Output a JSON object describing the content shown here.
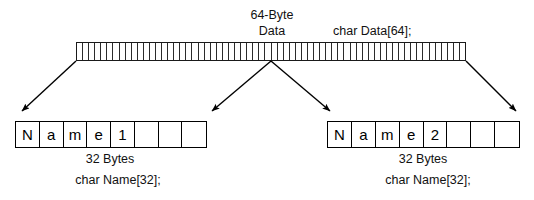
{
  "diagram": {
    "background": "#ffffff",
    "line_color": "#000000",
    "data_strip": {
      "label_line1": "64-Byte",
      "label_line2": "Data",
      "declaration": "char Data[64];",
      "cell_count": 64,
      "total_bytes": 64
    },
    "fields": [
      {
        "id": "name1",
        "cells": [
          "N",
          "a",
          "m",
          "e",
          "1",
          "",
          "",
          ""
        ],
        "size_label": "32 Bytes",
        "declaration": "char Name[32];",
        "size_bytes": 32
      },
      {
        "id": "name2",
        "cells": [
          "N",
          "a",
          "m",
          "e",
          "2",
          "",
          "",
          ""
        ],
        "size_label": "32 Bytes",
        "declaration": "char Name[32];",
        "size_bytes": 32
      }
    ],
    "arrows": [
      {
        "name": "arrow-strip-start-to-name1-start",
        "from": "strip-left-edge",
        "to": "name1-left-edge"
      },
      {
        "name": "arrow-strip-mid-to-name1-end",
        "from": "strip-midpoint",
        "to": "name1-right-edge"
      },
      {
        "name": "arrow-strip-mid-to-name2-start",
        "from": "strip-midpoint",
        "to": "name2-left-edge"
      },
      {
        "name": "arrow-strip-end-to-name2-end",
        "from": "strip-right-edge",
        "to": "name2-right-edge"
      }
    ]
  }
}
